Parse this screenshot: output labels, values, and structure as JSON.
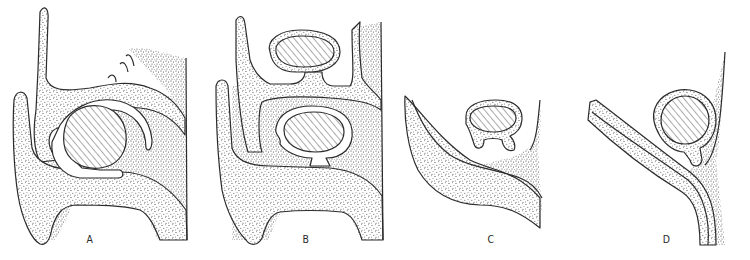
{
  "figure": {
    "type": "anatomical-developmental-diagram",
    "panels": [
      {
        "id": "A",
        "label": "A",
        "description": "Stippled tissue with two upward finger-like lobes and a large hatched ovoid body enclosed by a curved cavity"
      },
      {
        "id": "B",
        "label": "B",
        "description": "Two stacked hatched oval bodies, each on a stalk, within stippled tissue with two finger-like lobes"
      },
      {
        "id": "C",
        "label": "C",
        "description": "Single hatched oval body on a stalk above a curved stippled wedge"
      },
      {
        "id": "D",
        "label": "D",
        "description": "Round hatched body on a stalk beside a diagonal double-walled stippled band"
      }
    ],
    "colors": {
      "ink": "#2b2b2b",
      "stipple": "#3a3a3a",
      "background": "#ffffff"
    }
  }
}
